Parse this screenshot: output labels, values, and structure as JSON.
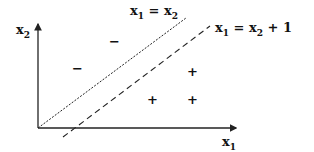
{
  "diagram": {
    "axes": {
      "x_label": {
        "base": "x",
        "sub": "1"
      },
      "y_label": {
        "base": "x",
        "sub": "2"
      }
    },
    "lines": [
      {
        "id": "boundary-1",
        "style": "dotted",
        "label": {
          "lhs_base": "x",
          "lhs_sub": "1",
          "eq": " = ",
          "rhs_base": "x",
          "rhs_sub": "2",
          "tail": ""
        }
      },
      {
        "id": "boundary-2",
        "style": "dashed",
        "label": {
          "lhs_base": "x",
          "lhs_sub": "1",
          "eq": " = ",
          "rhs_base": "x",
          "rhs_sub": "2",
          "tail": " + 1"
        }
      }
    ],
    "points": {
      "negative_symbol": "−",
      "positive_symbol": "+",
      "negatives": [
        {
          "x": 115,
          "y": 42
        },
        {
          "x": 78,
          "y": 69
        }
      ],
      "positives": [
        {
          "x": 192,
          "y": 72
        },
        {
          "x": 152,
          "y": 100
        },
        {
          "x": 192,
          "y": 100
        }
      ]
    }
  }
}
